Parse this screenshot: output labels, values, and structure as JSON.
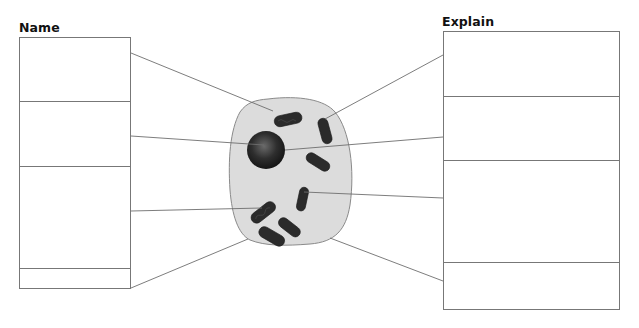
{
  "worksheet": {
    "left_heading": "Name",
    "right_heading": "Explain",
    "name_boxes": [
      {
        "id": 1,
        "value": ""
      },
      {
        "id": 2,
        "value": ""
      },
      {
        "id": 3,
        "value": ""
      },
      {
        "id": 4,
        "value": ""
      }
    ],
    "explain_boxes": [
      {
        "id": 1,
        "value": ""
      },
      {
        "id": 2,
        "value": ""
      },
      {
        "id": 3,
        "value": ""
      },
      {
        "id": 4,
        "value": ""
      }
    ]
  },
  "diagram": {
    "parts_depicted": [
      "cell membrane",
      "cytoplasm",
      "nucleus",
      "mitochondria"
    ],
    "colors": {
      "cytoplasm": "#dcdcdc",
      "membrane": "#8a8a8a",
      "nucleus": "#2a2a2a",
      "mitochondria": "#2b2b2b",
      "leader_lines": "#6e6e6e",
      "box_border": "#777777"
    }
  }
}
